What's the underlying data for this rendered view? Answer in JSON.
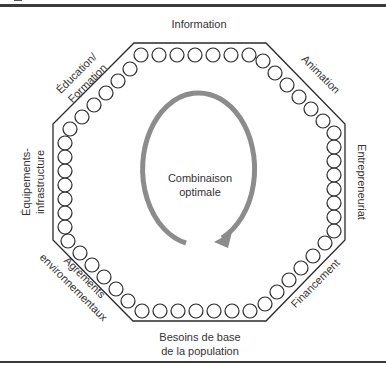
{
  "figure": {
    "center_label_line1": "Combinaison",
    "center_label_line2": "optimale",
    "colors": {
      "outline": "#2a2a2a",
      "arrow": "#8c8c8c",
      "text": "#333333"
    },
    "octagon": {
      "points": "134,43 266,43 345,124 345,240 266,321 133,321 53,240 53,124"
    },
    "sides": [
      {
        "id": "information",
        "lines": [
          "Information"
        ]
      },
      {
        "id": "animation",
        "lines": [
          "Animation"
        ]
      },
      {
        "id": "entrepreneuriat",
        "lines": [
          "Entrepreneuriat"
        ]
      },
      {
        "id": "financement",
        "lines": [
          "Financement"
        ]
      },
      {
        "id": "besoins",
        "lines": [
          "Besoins de base",
          "de la population"
        ]
      },
      {
        "id": "agrements",
        "lines": [
          "Agréments",
          "environnementaux"
        ]
      },
      {
        "id": "equipements",
        "lines": [
          "Équipements-",
          "infrastructure"
        ]
      },
      {
        "id": "education",
        "lines": [
          "Éducation/",
          "Formation"
        ]
      }
    ],
    "circle_radius": 7,
    "circles": [
      [
        141,
        55
      ],
      [
        159,
        55
      ],
      [
        177,
        55
      ],
      [
        195,
        55
      ],
      [
        213,
        55
      ],
      [
        231,
        55
      ],
      [
        249,
        55
      ],
      [
        263,
        61
      ],
      [
        275,
        73
      ],
      [
        287,
        85
      ],
      [
        299,
        97
      ],
      [
        311,
        109
      ],
      [
        323,
        121
      ],
      [
        334,
        133
      ],
      [
        334,
        147
      ],
      [
        334,
        161
      ],
      [
        334,
        175
      ],
      [
        334,
        189
      ],
      [
        334,
        203
      ],
      [
        334,
        217
      ],
      [
        334,
        231
      ],
      [
        325,
        243
      ],
      [
        313,
        256
      ],
      [
        301,
        268
      ],
      [
        289,
        280
      ],
      [
        277,
        292
      ],
      [
        265,
        304
      ],
      [
        250,
        311
      ],
      [
        232,
        311
      ],
      [
        214,
        311
      ],
      [
        196,
        311
      ],
      [
        178,
        311
      ],
      [
        160,
        311
      ],
      [
        142,
        311
      ],
      [
        128,
        301
      ],
      [
        116,
        289
      ],
      [
        104,
        277
      ],
      [
        92,
        265
      ],
      [
        80,
        253
      ],
      [
        68,
        241
      ],
      [
        65,
        227
      ],
      [
        65,
        213
      ],
      [
        65,
        199
      ],
      [
        65,
        185
      ],
      [
        65,
        171
      ],
      [
        65,
        157
      ],
      [
        65,
        143
      ],
      [
        70,
        129
      ],
      [
        82,
        117
      ],
      [
        94,
        105
      ],
      [
        106,
        93
      ],
      [
        118,
        81
      ],
      [
        130,
        69
      ]
    ]
  }
}
